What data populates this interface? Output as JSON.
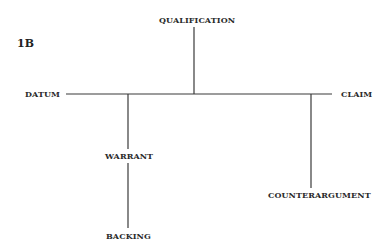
{
  "figure": {
    "label": "1B"
  },
  "nodes": {
    "qualification": "QUALIFICATION",
    "datum": "DATUM",
    "claim": "CLAIM",
    "warrant": "WARRANT",
    "backing": "BACKING",
    "counterargument": "COUNTERARGUMENT"
  },
  "edges": [
    {
      "from": "datum",
      "to": "claim",
      "type": "main-line"
    },
    {
      "from": "qualification",
      "to": "main-line"
    },
    {
      "from": "warrant",
      "to": "main-line"
    },
    {
      "from": "backing",
      "to": "warrant"
    },
    {
      "from": "counterargument",
      "to": "main-line"
    }
  ],
  "colors": {
    "line": "#3a3a3a",
    "text": "#2a2a2a",
    "background": "#ffffff"
  }
}
